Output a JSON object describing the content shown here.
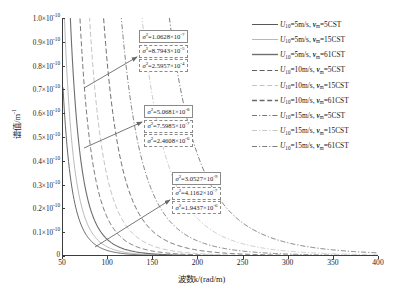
{
  "chart_data": {
    "type": "line",
    "title": "",
    "xlabel": "波数k/(rad/m)",
    "ylabel": "谱值/m",
    "ylabel_exp": "-1",
    "xlim": [
      50,
      400
    ],
    "ylim": [
      0,
      1e-10
    ],
    "grid": false,
    "legend_position": "right",
    "xticks": [
      "50",
      "100",
      "150",
      "200",
      "250",
      "300",
      "350",
      "400"
    ],
    "xtick_values": [
      50,
      100,
      150,
      200,
      250,
      300,
      350,
      400
    ],
    "yticks": [
      {
        "mantissa": "0",
        "exp": "",
        "value": 0.0
      },
      {
        "mantissa": "0.1×10",
        "exp": "-10",
        "value": 0.1
      },
      {
        "mantissa": "0.2×10",
        "exp": "-10",
        "value": 0.2
      },
      {
        "mantissa": "0.3×10",
        "exp": "-10",
        "value": 0.3
      },
      {
        "mantissa": "0.4×10",
        "exp": "-10",
        "value": 0.4
      },
      {
        "mantissa": "0.5×10",
        "exp": "-10",
        "value": 0.5
      },
      {
        "mantissa": "0.6×10",
        "exp": "-10",
        "value": 0.6
      },
      {
        "mantissa": "0.7×10",
        "exp": "-10",
        "value": 0.7
      },
      {
        "mantissa": "0.8×10",
        "exp": "-10",
        "value": 0.8
      },
      {
        "mantissa": "0.9×10",
        "exp": "-10",
        "value": 0.9
      },
      {
        "mantissa": "1.0×10",
        "exp": "-10",
        "value": 1.0
      }
    ],
    "series": [
      {
        "name": "U10=5m/s, vm=5CST",
        "wind": "5",
        "visc": "5",
        "style": "solid",
        "color": "#585858",
        "width": 0.9,
        "decay_k": 57,
        "amp": 1.0
      },
      {
        "name": "U10=5m/s, vm=15CST",
        "wind": "5",
        "visc": "15",
        "style": "solid",
        "color": "#a8a8a8",
        "width": 0.8,
        "decay_k": 63,
        "amp": 1.0
      },
      {
        "name": "U10=5m/s, vm=61CST",
        "wind": "5",
        "visc": "61",
        "style": "solid",
        "color": "#6e6e6e",
        "width": 1.1,
        "decay_k": 71,
        "amp": 1.0
      },
      {
        "name": "U10=10m/s, vm=5CST",
        "wind": "10",
        "visc": "5",
        "style": "dashed",
        "color": "#6b6b6b",
        "width": 0.9,
        "decay_k": 84,
        "amp": 1.0
      },
      {
        "name": "U10=10m/s, vm=15CST",
        "wind": "10",
        "visc": "15",
        "style": "dashed",
        "color": "#b4b4b4",
        "width": 0.8,
        "decay_k": 97,
        "amp": 1.0
      },
      {
        "name": "U10=10m/s, vm=61CST",
        "wind": "10",
        "visc": "61",
        "style": "dashed",
        "color": "#707070",
        "width": 1.0,
        "decay_k": 116,
        "amp": 1.0
      },
      {
        "name": "U10=15m/s, vm=5CST",
        "wind": "15",
        "visc": "5",
        "style": "dashdot",
        "color": "#777777",
        "width": 0.9,
        "decay_k": 140,
        "amp": 1.0
      },
      {
        "name": "U10=15m/s, vm=15CST",
        "wind": "15",
        "visc": "15",
        "style": "dashdot",
        "color": "#bcbcbc",
        "width": 0.8,
        "decay_k": 168,
        "amp": 1.0
      },
      {
        "name": "U10=15m/s, vm=61CST",
        "wind": "15",
        "visc": "61",
        "style": "dashdot",
        "color": "#7d7d7d",
        "width": 1.0,
        "decay_k": 205,
        "amp": 1.0
      }
    ],
    "annotations": [
      {
        "group": "top",
        "boxes": [
          {
            "text": "σ²=1.0628×10",
            "exp": "-7",
            "style": "solid"
          },
          {
            "text": "σ²=8.7943×10",
            "exp": "-5",
            "style": "dashed"
          },
          {
            "text": "σ²=2.5957×10",
            "exp": "-4",
            "style": "dashdot"
          }
        ]
      },
      {
        "group": "middle",
        "boxes": [
          {
            "text": "σ²=5.0681×10",
            "exp": "-8",
            "style": "solid"
          },
          {
            "text": "σ²=7.5985×10",
            "exp": "-7",
            "style": "dashed"
          },
          {
            "text": "σ²=2.4608×10",
            "exp": "-6",
            "style": "dashdot"
          }
        ]
      },
      {
        "group": "bottom",
        "boxes": [
          {
            "text": "σ²=3.0527×10",
            "exp": "-9",
            "style": "solid"
          },
          {
            "text": "σ²=4.1162×10",
            "exp": "-7",
            "style": "dashed"
          },
          {
            "text": "σ²=1.9437×10",
            "exp": "-6",
            "style": "dashdot"
          }
        ]
      }
    ]
  },
  "legend": {
    "entries": [
      {
        "u_sym": "U",
        "u_sub": "10",
        "u_val": "=5m/s, ",
        "nu_sym": "ν",
        "nu_sub": "m",
        "nu_val": "=5CST",
        "style": "solid",
        "color": "#585858",
        "width": 1.0
      },
      {
        "u_sym": "U",
        "u_sub": "10",
        "u_val": "=5m/s, ",
        "nu_sym": "ν",
        "nu_sub": "m",
        "nu_val": "=15CST",
        "style": "solid",
        "color": "#b0b0b0",
        "width": 0.9
      },
      {
        "u_sym": "U",
        "u_sub": "10",
        "u_val": "=5m/s, ",
        "nu_sym": "ν",
        "nu_sub": "m",
        "nu_val": "=61CST",
        "style": "solid",
        "color": "#6e6e6e",
        "width": 1.4
      },
      {
        "u_sym": "U",
        "u_sub": "10",
        "u_val": "=10m/s, ",
        "nu_sym": "ν",
        "nu_sub": "m",
        "nu_val": "=5CST",
        "style": "dashed",
        "color": "#5f5f5f",
        "width": 1.0
      },
      {
        "u_sym": "U",
        "u_sub": "10",
        "u_val": "=10m/s, ",
        "nu_sym": "ν",
        "nu_sub": "m",
        "nu_val": "=15CST",
        "style": "dashed",
        "color": "#bcbcbc",
        "width": 0.9
      },
      {
        "u_sym": "U",
        "u_sub": "10",
        "u_val": "=10m/s, ",
        "nu_sym": "ν",
        "nu_sub": "m",
        "nu_val": "=61CST",
        "style": "dashed",
        "color": "#6a6a6a",
        "width": 1.3
      },
      {
        "u_sym": "U",
        "u_sub": "10",
        "u_val": "=15m/s, ",
        "nu_sym": "ν",
        "nu_sub": "m",
        "nu_val": "=5CST",
        "style": "dashdot",
        "color": "#777777",
        "width": 1.0
      },
      {
        "u_sym": "U",
        "u_sub": "10",
        "u_val": "=15m/s, ",
        "nu_sym": "ν",
        "nu_sub": "m",
        "nu_val": "=15CST",
        "style": "dashdot",
        "color": "#c2c2c2",
        "width": 0.9
      },
      {
        "u_sym": "U",
        "u_sub": "10",
        "u_val": "=15m/s, ",
        "nu_sym": "ν",
        "nu_sub": "m",
        "nu_val": "=61CST",
        "style": "dashdot",
        "color": "#7d7d7d",
        "width": 1.2
      }
    ]
  },
  "colors": {
    "axis": "#3c3c3c",
    "box_border": "#8a8a8a",
    "arrow": "#6a6a6a",
    "background": "#ffffff"
  }
}
